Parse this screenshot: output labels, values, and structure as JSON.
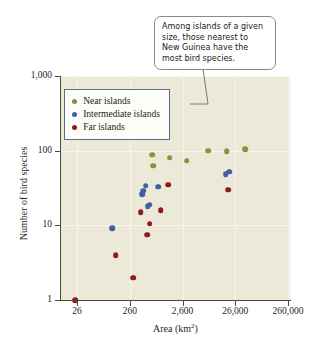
{
  "figure": {
    "callout": {
      "text": "Among islands of a given size, those nearest to New Guinea have the most bird species."
    },
    "legend": {
      "title": "",
      "entries": [
        {
          "label": "Near islands",
          "color": "#7a9a3c"
        },
        {
          "label": "Intermediate islands",
          "color": "#3f5fa8"
        },
        {
          "label": "Far islands",
          "color": "#8f1b1b"
        }
      ]
    }
  },
  "chart_data": {
    "type": "scatter",
    "title": "",
    "subtitle": "",
    "xlabel": "Area (km2)",
    "xlabel_html": "Area (km<sup>2</sup>)",
    "ylabel": "Number of bird species",
    "xscale": "log",
    "yscale": "log",
    "xlim": [
      26,
      260000
    ],
    "ylim": [
      1,
      1000
    ],
    "xticks": [
      26,
      260,
      2600,
      26000,
      260000
    ],
    "xticklabels": [
      "26",
      "260",
      "2,600",
      "26,000",
      "260,000"
    ],
    "yticks": [
      1,
      10,
      100,
      1000
    ],
    "yticklabels": [
      "1",
      "10",
      "100",
      "1,000"
    ],
    "grid": true,
    "legend_position": "upper-left-inside",
    "annotations": [
      {
        "text": "Among islands of a given size, those nearest to New Guinea have the most bird species.",
        "points_to_x": 18000,
        "points_to_y": 105
      }
    ],
    "series": [
      {
        "name": "Near islands",
        "color": "#7a9a3c",
        "points": [
          {
            "x": 700,
            "y": 88
          },
          {
            "x": 720,
            "y": 63
          },
          {
            "x": 1500,
            "y": 80
          },
          {
            "x": 3100,
            "y": 73
          },
          {
            "x": 8000,
            "y": 100
          },
          {
            "x": 18000,
            "y": 98
          },
          {
            "x": 40000,
            "y": 104
          }
        ]
      },
      {
        "name": "Intermediate islands",
        "color": "#3f5fa8",
        "points": [
          {
            "x": 120,
            "y": 9.2
          },
          {
            "x": 520,
            "y": 34
          },
          {
            "x": 470,
            "y": 29
          },
          {
            "x": 450,
            "y": 26
          },
          {
            "x": 570,
            "y": 18
          },
          {
            "x": 620,
            "y": 19
          },
          {
            "x": 900,
            "y": 33
          },
          {
            "x": 17000,
            "y": 48
          },
          {
            "x": 20000,
            "y": 52
          }
        ]
      },
      {
        "name": "Far islands",
        "color": "#8f1b1b",
        "points": [
          {
            "x": 24,
            "y": 1
          },
          {
            "x": 140,
            "y": 4
          },
          {
            "x": 300,
            "y": 2
          },
          {
            "x": 420,
            "y": 15
          },
          {
            "x": 560,
            "y": 7.5
          },
          {
            "x": 620,
            "y": 10.5
          },
          {
            "x": 1000,
            "y": 16
          },
          {
            "x": 1400,
            "y": 35
          },
          {
            "x": 19000,
            "y": 30
          }
        ]
      }
    ]
  }
}
